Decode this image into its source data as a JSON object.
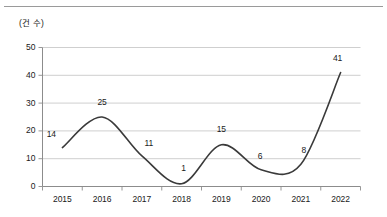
{
  "figure": {
    "unit_label": "(건 수)",
    "top_rule_color": "#9a9a9a",
    "line_color": "#3a3a3a",
    "grid_color": "#c9c9c9",
    "axis_color": "#8c8c8c",
    "text_color": "#1a1a1a"
  },
  "chart_data": {
    "type": "line",
    "title": "",
    "subtitle": "",
    "xlabel": "",
    "ylabel": "(건 수)",
    "categories": [
      "2015",
      "2016",
      "2017",
      "2018",
      "2019",
      "2020",
      "2021",
      "2022"
    ],
    "values": [
      14,
      25,
      11,
      1,
      15,
      6,
      8,
      41
    ],
    "point_labels": [
      "14",
      "25",
      "11",
      "1",
      "15",
      "6",
      "8",
      "41"
    ],
    "series": [
      {
        "name": "건수",
        "values": [
          14,
          25,
          11,
          1,
          15,
          6,
          8,
          41
        ]
      }
    ],
    "ylim": [
      0,
      50
    ],
    "yticks": [
      0,
      10,
      20,
      30,
      40,
      50
    ],
    "ytick_labels": [
      "0",
      "10",
      "20",
      "30",
      "40",
      "50"
    ],
    "grid": true,
    "grid_axis": "y",
    "legend": false,
    "legend_position": "none",
    "markers": false,
    "smooth": true,
    "annotations": []
  }
}
